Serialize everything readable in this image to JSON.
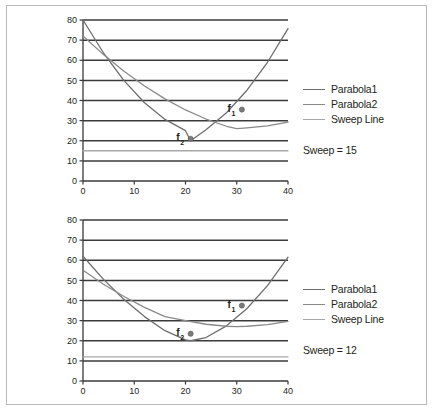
{
  "figure": {
    "name": "parabola-sweep-line-figure",
    "background": "#ffffff",
    "border_color": "#b9b9b9"
  },
  "colors": {
    "grid": "#3a3a3a",
    "axis": "#3a3a3a",
    "parabola1": "#6e6e6e",
    "parabola2": "#8a8a8a",
    "sweep_line": "#a8a8a8",
    "marker": "#7a7a7a",
    "text": "#231f20"
  },
  "legend": {
    "items": [
      {
        "label": "Parabola1",
        "color": "#6e6e6e"
      },
      {
        "label": "Parabola2",
        "color": "#8a8a8a"
      },
      {
        "label": "Sweep Line",
        "color": "#a8a8a8"
      }
    ]
  },
  "chart_data": [
    {
      "type": "line",
      "name": "top-chart",
      "title": "",
      "xlabel": "",
      "ylabel": "",
      "xlim": [
        0,
        40
      ],
      "ylim": [
        0,
        80
      ],
      "xticks": [
        0,
        10,
        20,
        30,
        40
      ],
      "yticks": [
        0,
        10,
        20,
        30,
        40,
        50,
        60,
        70,
        80
      ],
      "grid": true,
      "legend_position": "right",
      "sweep_label": "Sweep = 15",
      "sweep_value": 15,
      "series": [
        {
          "name": "Parabola1",
          "color": "#6e6e6e",
          "vertex": [
            21,
            20
          ],
          "x": [
            0,
            4,
            8,
            12,
            16,
            20,
            21,
            24,
            28,
            32,
            36,
            40
          ],
          "y": [
            80,
            63.6,
            49.9,
            38.9,
            30.6,
            25.0,
            20.0,
            25.5,
            33.9,
            45.1,
            59.0,
            75.7
          ]
        },
        {
          "name": "Parabola2",
          "color": "#8a8a8a",
          "vertex": [
            30,
            26
          ],
          "x": [
            0,
            4,
            8,
            12,
            16,
            20,
            24,
            28,
            30,
            32,
            36,
            40
          ],
          "y": [
            72.0,
            62.8,
            54.5,
            47.2,
            40.8,
            35.3,
            30.8,
            27.2,
            26.0,
            26.4,
            27.4,
            29.3
          ]
        },
        {
          "name": "Sweep Line",
          "color": "#a8a8a8",
          "x": [
            0,
            40
          ],
          "y": [
            15,
            15
          ]
        }
      ],
      "annotations": [
        {
          "label": "f",
          "subscript": "1",
          "x": 31,
          "y": 35.5,
          "marker": true
        },
        {
          "label": "f",
          "subscript": "2",
          "x": 21,
          "y": 21.0,
          "marker": true
        }
      ]
    },
    {
      "type": "line",
      "name": "bottom-chart",
      "title": "",
      "xlabel": "",
      "ylabel": "",
      "xlim": [
        0,
        40
      ],
      "ylim": [
        0,
        80
      ],
      "xticks": [
        0,
        10,
        20,
        30,
        40
      ],
      "yticks": [
        0,
        10,
        20,
        30,
        40,
        50,
        60,
        70,
        80
      ],
      "grid": true,
      "legend_position": "right",
      "sweep_label": "Sweep = 12",
      "sweep_value": 12,
      "series": [
        {
          "name": "Parabola1",
          "color": "#6e6e6e",
          "vertex": [
            21,
            20
          ],
          "x": [
            0,
            4,
            8,
            12,
            16,
            20,
            21,
            24,
            28,
            32,
            36,
            40
          ],
          "y": [
            62.0,
            50.5,
            40.5,
            32.0,
            25.0,
            20.4,
            20.0,
            21.6,
            27.4,
            36.0,
            47.4,
            61.5
          ]
        },
        {
          "name": "Parabola2",
          "color": "#8a8a8a",
          "vertex": [
            30,
            27
          ],
          "x": [
            0,
            4,
            8,
            12,
            16,
            20,
            24,
            28,
            30,
            32,
            36,
            40
          ],
          "y": [
            55.0,
            48.1,
            42.0,
            36.6,
            32.0,
            30.0,
            28.2,
            27.2,
            27.0,
            27.2,
            28.0,
            29.6
          ]
        },
        {
          "name": "Sweep Line",
          "color": "#a8a8a8",
          "x": [
            0,
            40
          ],
          "y": [
            12,
            12
          ]
        }
      ],
      "annotations": [
        {
          "label": "f",
          "subscript": "1",
          "x": 31,
          "y": 37.5,
          "marker": true
        },
        {
          "label": "f",
          "subscript": "2",
          "x": 21,
          "y": 23.5,
          "marker": true
        }
      ]
    }
  ]
}
